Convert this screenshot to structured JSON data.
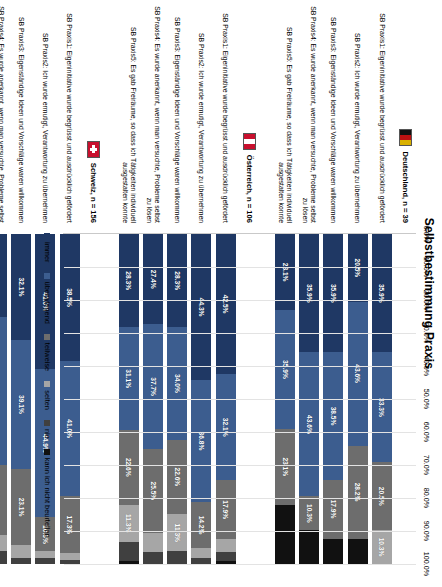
{
  "chart": {
    "title": "Selbstbestimmung Praxis",
    "type": "stacked-bar-100"
  },
  "axis": {
    "ticks": [
      "0.0%",
      "10.0%",
      "20.0%",
      "30.0%",
      "40.0%",
      "50.0%",
      "60.0%",
      "70.0%",
      "80.0%",
      "90.0%",
      "100.0%"
    ],
    "xlabel": "",
    "ylabel": ""
  },
  "legend": {
    "position": "bottom",
    "items": [
      {
        "label": "immer",
        "color": "#1f3864"
      },
      {
        "label": "überwiegend",
        "color": "#3c5d8f"
      },
      {
        "label": "teilweise",
        "color": "#6d6d6d"
      },
      {
        "label": "selten",
        "color": "#a6a6a6"
      },
      {
        "label": "nie",
        "color": "#404040"
      },
      {
        "label": "kann ich nicht beurteilen",
        "color": "#111111"
      }
    ]
  },
  "groups": [
    {
      "name": "Deutschland",
      "n_label": "Deutschland,  n = 39",
      "flag": "flag-de",
      "rows": [
        {
          "label": "SB Praxis1: Eigeninitiative wurde begrüsst und ausdrücklich gefördert",
          "values": [
            35.9,
            33.3,
            20.5,
            10.3,
            0.0,
            0.0
          ],
          "shown": [
            "35.9%",
            "33.3%",
            "20.5%",
            "10.3%",
            "",
            ""
          ]
        },
        {
          "label": "SB Praxis2: Ich wurde ermutigt, Verantwortung zu übernehmen",
          "values": [
            20.5,
            43.6,
            28.2,
            0.0,
            0.0,
            7.7
          ],
          "shown": [
            "20.5%",
            "43.6%",
            "28.2%",
            "",
            "",
            ""
          ]
        },
        {
          "label": "SB Praxis3: Eigenständige Ideen und Vorschläge waren willkommen",
          "values": [
            35.9,
            38.5,
            17.9,
            0.0,
            0.0,
            7.7
          ],
          "shown": [
            "35.9%",
            "38.5%",
            "17.9%",
            "",
            "",
            ""
          ]
        },
        {
          "label": "SB Praxis4: Es wurde anerkannt, wenn man versuchte, Probleme selbst zu lösen",
          "values": [
            35.9,
            43.6,
            10.3,
            0.0,
            0.0,
            10.2
          ],
          "shown": [
            "35.9%",
            "43.6%",
            "10.3%",
            "",
            "",
            ""
          ]
        },
        {
          "label": "SB Praxis5: Es gab Freiräume, so dass ich Tätigkeiten individuell ausgestalten konnte",
          "values": [
            23.1,
            35.9,
            23.1,
            0.0,
            0.0,
            17.9
          ],
          "shown": [
            "23.1%",
            "35.9%",
            "23.1%",
            "",
            "",
            ""
          ]
        }
      ]
    },
    {
      "name": "Österreich",
      "n_label": "Österreich,  n = 106",
      "flag": "flag-at",
      "rows": [
        {
          "label": "SB Praxis1: Eigeninitiative wurde begrüsst und ausdrücklich gefördert",
          "values": [
            42.5,
            32.1,
            17.9,
            3.8,
            2.8,
            0.9
          ],
          "shown": [
            "42.5%",
            "32.1%",
            "17.9%",
            "",
            "",
            ""
          ]
        },
        {
          "label": "SB Praxis2: Ich wurde ermutigt, Verantwortung zu übernehmen",
          "values": [
            44.3,
            36.8,
            14.2,
            2.8,
            1.9,
            0.0
          ],
          "shown": [
            "44.3%",
            "36.8%",
            "14.2%",
            "",
            "",
            ""
          ]
        },
        {
          "label": "SB Praxis3: Eigenständige Ideen und Vorschläge waren willkommen",
          "values": [
            28.3,
            34.0,
            22.6,
            11.3,
            3.8,
            0.0
          ],
          "shown": [
            "28.3%",
            "34.0%",
            "22.6%",
            "11.3%",
            "",
            ""
          ]
        },
        {
          "label": "SB Praxis4: Es wurde anerkannt, wenn man versuchte, Probleme selbst zu lösen",
          "values": [
            27.4,
            37.7,
            25.5,
            5.7,
            3.7,
            0.0
          ],
          "shown": [
            "27.4%",
            "37.7%",
            "25.5%",
            "",
            "",
            ""
          ]
        },
        {
          "label": "SB Praxis5: Es gab Freiräume, so dass ich Tätigkeiten individuell ausgestalten konnte",
          "values": [
            28.3,
            31.1,
            22.6,
            11.3,
            5.7,
            1.0
          ],
          "shown": [
            "28.3%",
            "31.1%",
            "22.6%",
            "11.3%",
            "",
            ""
          ]
        }
      ]
    },
    {
      "name": "Schweiz",
      "n_label": "Schweiz,  n = 156",
      "flag": "flag-ch",
      "rows": [
        {
          "label": "SB Praxis1: Eigeninitiative wurde begrüsst und ausdrücklich gefördert",
          "values": [
            38.5,
            41.0,
            17.3,
            1.9,
            1.3,
            0.0
          ],
          "shown": [
            "38.5%",
            "41.0%",
            "17.3%",
            "",
            "",
            ""
          ]
        },
        {
          "label": "SB Praxis2: Ich wurde ermutigt, Verantwortung zu übernehmen",
          "values": [
            41.0,
            44.9,
            10.3,
            1.9,
            1.9,
            0.0
          ],
          "shown": [
            "41.0%",
            "44.9%",
            "10.3%",
            "",
            "",
            ""
          ]
        },
        {
          "label": "SB Praxis3: Eigenständige Ideen und Vorschläge waren willkommen",
          "values": [
            32.1,
            39.1,
            23.1,
            3.8,
            1.9,
            0.0
          ],
          "shown": [
            "32.1%",
            "39.1%",
            "23.1%",
            "",
            "",
            ""
          ]
        },
        {
          "label": "SB Praxis4: Es wurde anerkannt, wenn man versuchte, Probleme selbst zu lösen",
          "values": [
            25.0,
            44.9,
            21.2,
            5.1,
            3.8,
            0.0
          ],
          "shown": [
            "25.0%",
            "44.9%",
            "21.2%",
            "",
            "",
            ""
          ]
        },
        {
          "label": "SB Praxis5: Es gab Freiräume, so dass ich Tätigkeiten individuell ausgestalten konnte",
          "values": [
            20.5,
            36.5,
            30.8,
            7.1,
            5.1,
            0.0
          ],
          "shown": [
            "20.5%",
            "36.5%",
            "30.8%",
            "",
            "",
            ""
          ]
        }
      ]
    }
  ],
  "chart_data": {
    "type": "bar",
    "title": "Selbstbestimmung Praxis",
    "xlabel": "",
    "ylabel": "",
    "xlim": [
      0,
      100
    ],
    "grid": true,
    "orientation": "horizontal",
    "stacked": "100%",
    "legend_position": "bottom",
    "tick_labels": [
      "0.0%",
      "10.0%",
      "20.0%",
      "30.0%",
      "40.0%",
      "50.0%",
      "60.0%",
      "70.0%",
      "80.0%",
      "90.0%",
      "100.0%"
    ],
    "series": [
      {
        "name": "immer",
        "color": "#1f3864",
        "values": [
          35.9,
          20.5,
          35.9,
          35.9,
          23.1,
          42.5,
          44.3,
          28.3,
          27.4,
          28.3,
          38.5,
          41.0,
          32.1,
          25.0,
          20.5
        ]
      },
      {
        "name": "überwiegend",
        "color": "#3c5d8f",
        "values": [
          33.3,
          43.6,
          38.5,
          43.6,
          35.9,
          32.1,
          36.8,
          34.0,
          37.7,
          31.1,
          41.0,
          44.9,
          39.1,
          44.9,
          36.5
        ]
      },
      {
        "name": "teilweise",
        "color": "#6d6d6d",
        "values": [
          20.5,
          28.2,
          17.9,
          10.3,
          23.1,
          17.9,
          14.2,
          22.6,
          25.5,
          22.6,
          17.3,
          10.3,
          23.1,
          21.2,
          30.8
        ]
      },
      {
        "name": "selten",
        "color": "#a6a6a6",
        "values": [
          10.3,
          0.0,
          0.0,
          0.0,
          0.0,
          3.8,
          2.8,
          11.3,
          5.7,
          11.3,
          1.9,
          1.9,
          3.8,
          5.1,
          7.1
        ]
      },
      {
        "name": "nie",
        "color": "#404040",
        "values": [
          0.0,
          0.0,
          0.0,
          0.0,
          0.0,
          2.8,
          1.9,
          3.8,
          3.7,
          5.7,
          1.3,
          1.9,
          1.9,
          3.8,
          5.1
        ]
      },
      {
        "name": "kann ich nicht beurteilen",
        "color": "#111111",
        "values": [
          0.0,
          7.7,
          7.7,
          10.2,
          17.9,
          0.9,
          0.0,
          0.0,
          0.0,
          1.0,
          0.0,
          0.0,
          0.0,
          0.0,
          0.0
        ]
      }
    ],
    "categories": [
      "Deutschland n=39 — SB Praxis1: Eigeninitiative wurde begrüsst und ausdrücklich gefördert",
      "Deutschland n=39 — SB Praxis2: Ich wurde ermutigt, Verantwortung zu übernehmen",
      "Deutschland n=39 — SB Praxis3: Eigenständige Ideen und Vorschläge waren willkommen",
      "Deutschland n=39 — SB Praxis4: Es wurde anerkannt, wenn man versuchte, Probleme selbst zu lösen",
      "Deutschland n=39 — SB Praxis5: Es gab Freiräume, so dass ich Tätigkeiten individuell ausgestalten konnte",
      "Österreich n=106 — SB Praxis1: Eigeninitiative wurde begrüsst und ausdrücklich gefördert",
      "Österreich n=106 — SB Praxis2: Ich wurde ermutigt, Verantwortung zu übernehmen",
      "Österreich n=106 — SB Praxis3: Eigenständige Ideen und Vorschläge waren willkommen",
      "Österreich n=106 — SB Praxis4: Es wurde anerkannt, wenn man versuchte, Probleme selbst zu lösen",
      "Österreich n=106 — SB Praxis5: Es gab Freiräume, so dass ich Tätigkeiten individuell ausgestalten konnte",
      "Schweiz n=156 — SB Praxis1: Eigeninitiative wurde begrüsst und ausdrücklich gefördert",
      "Schweiz n=156 — SB Praxis2: Ich wurde ermutigt, Verantwortung zu übernehmen",
      "Schweiz n=156 — SB Praxis3: Eigenständige Ideen und Vorschläge waren willkommen",
      "Schweiz n=156 — SB Praxis4: Es wurde anerkannt, wenn man versuchte, Probleme selbst zu lösen",
      "Schweiz n=156 — SB Praxis5: Es gab Freiräume, so dass ich Tätigkeiten individuell ausgestalten konnte"
    ]
  }
}
